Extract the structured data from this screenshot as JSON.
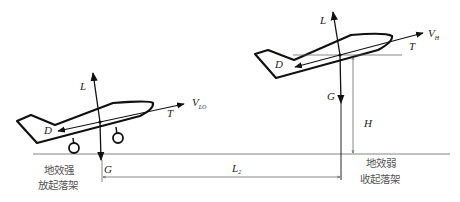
{
  "diagram": {
    "left_aircraft": {
      "labels": {
        "lift": "L",
        "drag": "D",
        "thrust": "T",
        "weight": "G",
        "velocity": "V",
        "velocity_sub": "LO"
      },
      "caption_line1": "地效强",
      "caption_line2": "放起落架"
    },
    "right_aircraft": {
      "labels": {
        "lift": "L",
        "drag": "D",
        "thrust": "T",
        "weight": "G",
        "velocity": "V",
        "velocity_sub": "H",
        "height": "H"
      },
      "caption_line1": "地效弱",
      "caption_line2": "收起落架"
    },
    "distance": {
      "label": "L",
      "label_sub": "2"
    }
  }
}
